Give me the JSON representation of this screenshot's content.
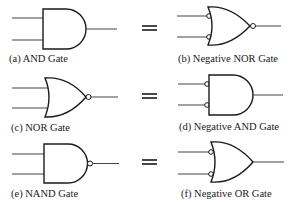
{
  "diagram": {
    "type": "logic-gate-equivalences",
    "rows": [
      {
        "left": {
          "id": "a",
          "label": "(a) AND Gate",
          "gate": "AND",
          "input_bubbles": false,
          "output_bubble": false
        },
        "equals": "=",
        "right": {
          "id": "b",
          "label": "(b) Negative NOR Gate",
          "gate": "NOR",
          "input_bubbles": true,
          "output_bubble": true
        }
      },
      {
        "left": {
          "id": "c",
          "label": "(c) NOR Gate",
          "gate": "OR",
          "input_bubbles": false,
          "output_bubble": true
        },
        "equals": "=",
        "right": {
          "id": "d",
          "label": "(d) Negative AND Gate",
          "gate": "AND",
          "input_bubbles": true,
          "output_bubble": false
        }
      },
      {
        "left": {
          "id": "e",
          "label": "(e) NAND Gate",
          "gate": "AND",
          "input_bubbles": false,
          "output_bubble": true
        },
        "equals": "=",
        "right": {
          "id": "f",
          "label": "(f) Negative OR Gate",
          "gate": "OR",
          "input_bubbles": true,
          "output_bubble": false
        }
      }
    ],
    "colors": {
      "stroke": "#1a1a1a",
      "wire": "#444444",
      "background": "#ffffff"
    }
  }
}
